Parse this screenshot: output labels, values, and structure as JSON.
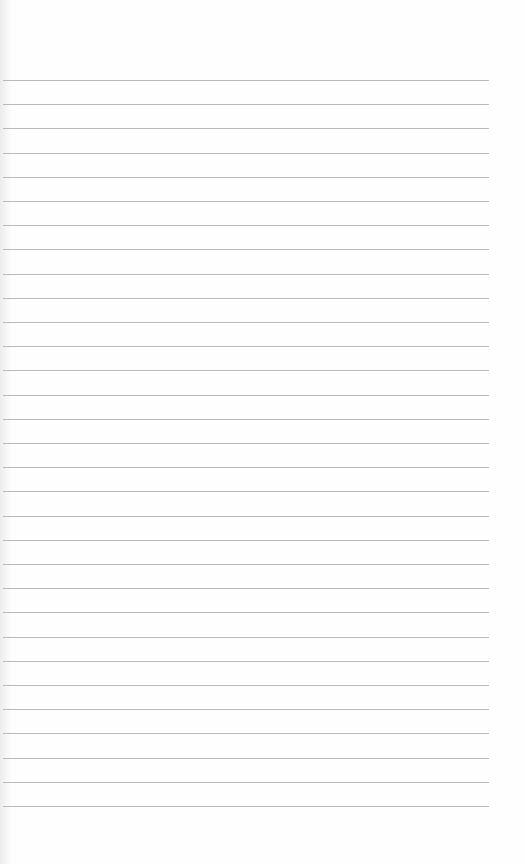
{
  "paper": {
    "type": "lined-paper",
    "line_count": 31,
    "first_line_y": 80,
    "line_spacing": 24.2,
    "line_color": "#b9b9b9",
    "background_color": "#fefefe"
  }
}
